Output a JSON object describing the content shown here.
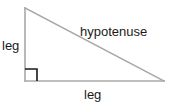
{
  "diagram": {
    "background_color": "#ffffff",
    "stroke_color": "#a8a8a8",
    "text_color": "#1a1a1a",
    "labels": {
      "leg_vertical": "leg",
      "leg_horizontal": "leg",
      "hypotenuse": "hypotenuse"
    },
    "geometry": {
      "apex": "25,8",
      "right_angle_vertex": "25,81",
      "right_vertex": "164,81",
      "right_angle_marker": "25,69 37,69 37,81",
      "vertical_leg": "25,8 25,81",
      "horizontal_leg": "25,81 164,81",
      "hypotenuse_line": "25,8 164,81"
    }
  }
}
